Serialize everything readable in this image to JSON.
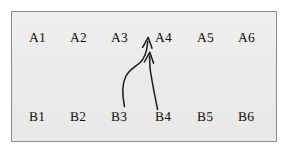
{
  "figure": {
    "background_color": "#ffffff",
    "panel_fill": "#ececeb",
    "panel_border_color": "#8b8b8b",
    "stroke_color": "#1a1a1a"
  },
  "grid": {
    "top_row": [
      {
        "id": "a1",
        "label": "A1"
      },
      {
        "id": "a2",
        "label": "A2"
      },
      {
        "id": "a3",
        "label": "A3"
      },
      {
        "id": "a4",
        "label": "A4"
      },
      {
        "id": "a5",
        "label": "A5"
      },
      {
        "id": "a6",
        "label": "A6"
      }
    ],
    "bottom_row": [
      {
        "id": "b1",
        "label": "B1"
      },
      {
        "id": "b2",
        "label": "B2"
      },
      {
        "id": "b3",
        "label": "B3"
      },
      {
        "id": "b4",
        "label": "B4"
      },
      {
        "id": "b5",
        "label": "B5"
      },
      {
        "id": "b6",
        "label": "B6"
      }
    ]
  },
  "arrows": [
    {
      "id": "arrow-b3-to-a4",
      "from": "B3",
      "to": "A4",
      "style": "curved",
      "head": "open-v"
    },
    {
      "id": "arrow-b4-to-a3a4-gap",
      "from": "B4",
      "to": "A3-A4",
      "style": "straight",
      "head": "open-v"
    }
  ]
}
